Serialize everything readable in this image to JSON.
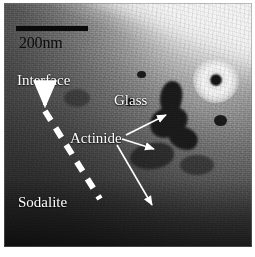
{
  "figure": {
    "kind": "electron-micrograph",
    "width_px": 255,
    "height_px": 257
  },
  "scale_bar": {
    "label": "200nm",
    "length_px": 72,
    "bar_color": "#0a0a0a",
    "text_color": "#0d0d0d"
  },
  "annotations": {
    "interface": {
      "label": "Interface",
      "color": "#ffffff"
    },
    "glass": {
      "label": "Glass",
      "color": "#ffffff"
    },
    "actinide": {
      "label": "Actinide",
      "color": "#ffffff"
    },
    "sodalite": {
      "label": "Sodalite",
      "color": "#ffffff"
    }
  },
  "markers": {
    "interface_line": {
      "style": "dashed",
      "color": "#ffffff",
      "arrowhead": "down"
    },
    "actinide_arrows": {
      "count": 3,
      "color": "#ffffff",
      "direction": "pointing-to-dark-inclusions"
    }
  },
  "regions": {
    "vacuum": {
      "position": "upper-right",
      "tone": "#ffffff"
    },
    "glass": {
      "position": "right-center",
      "tone": "#9a9a9a"
    },
    "sodalite": {
      "position": "lower-left",
      "tone": "#3a3a3a"
    },
    "inclusions": {
      "tone": "#1b1b1b"
    }
  },
  "features": {
    "halo_spot": {
      "description": "bright ring with dark core",
      "position": "upper-right"
    }
  }
}
